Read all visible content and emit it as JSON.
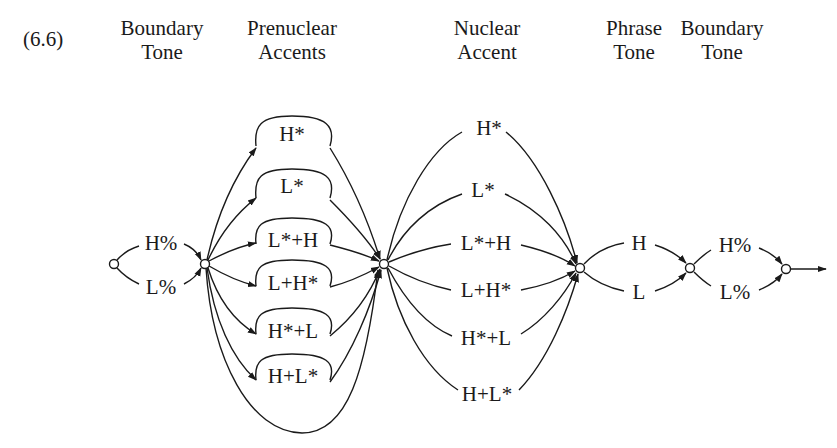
{
  "figure": {
    "number": "(6.6)",
    "columns": [
      {
        "line1": "Boundary",
        "line2": "Tone"
      },
      {
        "line1": "Prenuclear",
        "line2": "Accents"
      },
      {
        "line1": "Nuclear",
        "line2": "Accent"
      },
      {
        "line1": "Phrase",
        "line2": "Tone"
      },
      {
        "line1": "Boundary",
        "line2": "Tone"
      }
    ]
  },
  "initial_boundary": [
    "H%",
    "L%"
  ],
  "prenuclear_accents": [
    "H*",
    "L*",
    "L*+H",
    "L+H*",
    "H*+L",
    "H+L*"
  ],
  "nuclear_accents": [
    "H*",
    "L*",
    "L*+H",
    "L+H*",
    "H*+L",
    "H+L*"
  ],
  "phrase_tones": [
    "H",
    "L"
  ],
  "final_boundary": [
    "H%",
    "L%"
  ],
  "colors": {
    "ink": "#1a1a1a",
    "background": "#ffffff"
  }
}
